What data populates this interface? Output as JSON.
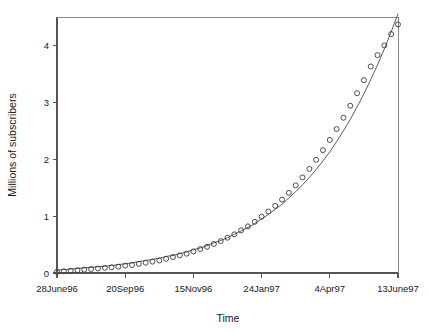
{
  "chart_data": {
    "type": "scatter",
    "title": "",
    "xlabel": "Time",
    "ylabel": "Millions of subscribers",
    "grid": false,
    "legend": null,
    "ylim": [
      0,
      4.5
    ],
    "yticks": [
      0,
      1,
      2,
      3,
      4
    ],
    "ytick_labels": [
      "0",
      "1",
      "2",
      "3",
      "4"
    ],
    "xlim": [
      0,
      50
    ],
    "xticks": [
      0,
      10,
      20,
      30,
      40,
      50
    ],
    "xtick_labels": [
      "28June96",
      "20Sep96",
      "15Nov96",
      "24Jan97",
      "4Apr97",
      "13June97"
    ],
    "series": [
      {
        "name": "observed subscribers",
        "marker": "open-circle",
        "x": [
          0,
          1,
          2,
          3,
          4,
          5,
          6,
          7,
          8,
          9,
          10,
          11,
          12,
          13,
          14,
          15,
          16,
          17,
          18,
          19,
          20,
          21,
          22,
          23,
          24,
          25,
          26,
          27,
          28,
          29,
          30,
          31,
          32,
          33,
          34,
          35,
          36,
          37,
          38,
          39,
          40,
          41,
          42,
          43,
          44,
          45,
          46,
          47,
          48,
          49,
          50
        ],
        "values": [
          0.02,
          0.03,
          0.04,
          0.05,
          0.06,
          0.07,
          0.08,
          0.09,
          0.1,
          0.11,
          0.13,
          0.14,
          0.16,
          0.18,
          0.2,
          0.22,
          0.25,
          0.28,
          0.31,
          0.34,
          0.38,
          0.42,
          0.46,
          0.51,
          0.56,
          0.62,
          0.68,
          0.75,
          0.82,
          0.9,
          0.99,
          1.08,
          1.18,
          1.29,
          1.41,
          1.54,
          1.68,
          1.83,
          1.99,
          2.16,
          2.34,
          2.53,
          2.73,
          2.94,
          3.16,
          3.39,
          3.63,
          3.83,
          4.0,
          4.2,
          4.37
        ]
      },
      {
        "name": "fitted exponential curve",
        "marker": "none",
        "x": [
          0,
          1,
          2,
          3,
          4,
          5,
          6,
          7,
          8,
          9,
          10,
          11,
          12,
          13,
          14,
          15,
          16,
          17,
          18,
          19,
          20,
          21,
          22,
          23,
          24,
          25,
          26,
          27,
          28,
          29,
          30,
          31,
          32,
          33,
          34,
          35,
          36,
          37,
          38,
          39,
          40,
          41,
          42,
          43,
          44,
          45,
          46,
          47,
          48,
          49,
          50
        ],
        "values": [
          0.05,
          0.06,
          0.07,
          0.08,
          0.09,
          0.1,
          0.11,
          0.12,
          0.13,
          0.15,
          0.16,
          0.18,
          0.2,
          0.22,
          0.24,
          0.26,
          0.29,
          0.31,
          0.34,
          0.37,
          0.41,
          0.44,
          0.48,
          0.53,
          0.57,
          0.62,
          0.68,
          0.74,
          0.8,
          0.87,
          0.95,
          1.03,
          1.12,
          1.21,
          1.32,
          1.43,
          1.55,
          1.68,
          1.82,
          1.97,
          2.13,
          2.31,
          2.5,
          2.7,
          2.92,
          3.15,
          3.4,
          3.66,
          3.94,
          4.24,
          4.56
        ]
      }
    ]
  },
  "plot": {
    "x_origin_px": 57,
    "x_max_px": 398,
    "y_origin_px": 273,
    "y_top_px": 17
  },
  "colors": {
    "axis": "#555555",
    "frame": "#8a8a8a",
    "marker": "#3a3a3a",
    "line": "#5a5a5a",
    "background": "#ffffff",
    "text": "#1a1a1a"
  }
}
